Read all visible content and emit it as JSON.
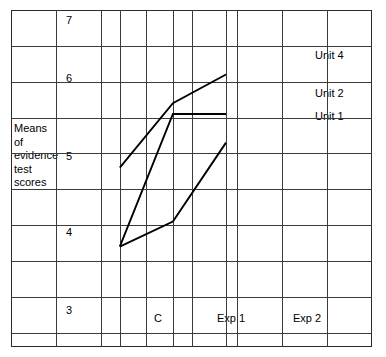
{
  "axis_title_lines": [
    "Means",
    "of",
    "evidence",
    "test",
    "scores"
  ],
  "y_ticks": [
    {
      "label": "7",
      "value": 7
    },
    {
      "label": "6",
      "value": 6
    },
    {
      "label": "5",
      "value": 5
    },
    {
      "label": "4",
      "value": 4
    },
    {
      "label": "3",
      "value": 3
    }
  ],
  "x_ticks": [
    {
      "label": "C",
      "value": 0
    },
    {
      "label": "Exp 1",
      "value": 1
    },
    {
      "label": "Exp 2",
      "value": 2
    }
  ],
  "series_labels": [
    {
      "name": "unit-4",
      "label": "Unit 4"
    },
    {
      "name": "unit-2",
      "label": "Unit 2"
    },
    {
      "name": "unit-1",
      "label": "Unit 1"
    }
  ],
  "colors": {
    "line": "#000000",
    "grid": "#3a3a3a",
    "frame": "#2b2b2b",
    "background": "#ffffff"
  },
  "chart_data": {
    "type": "line",
    "title": "",
    "xlabel": "",
    "ylabel": "Means of evidence test scores",
    "categories": [
      "C",
      "Exp 1",
      "Exp 2"
    ],
    "ylim": [
      2.6,
      7.3
    ],
    "xlim": [
      -2.05,
      4.75
    ],
    "grid": true,
    "legend_position": "right-inline",
    "series": [
      {
        "name": "Unit 4",
        "values": [
          5.1,
          6.0,
          6.4
        ]
      },
      {
        "name": "Unit 2",
        "values": [
          4.0,
          5.85,
          5.85
        ]
      },
      {
        "name": "Unit 1",
        "values": [
          4.0,
          4.35,
          5.45
        ]
      }
    ]
  }
}
